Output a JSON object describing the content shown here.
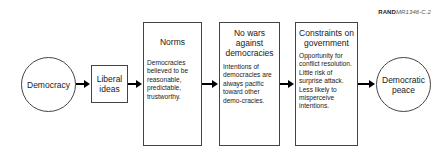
{
  "credit": {
    "org": "RAND",
    "code": "MR1346-C.2"
  },
  "nodes": [
    {
      "id": "democracy",
      "shape": "circle",
      "label": "Democracy"
    },
    {
      "id": "liberal-ideas",
      "shape": "box",
      "label": "Liberal ideas"
    },
    {
      "id": "norms",
      "shape": "box",
      "title": "Norms",
      "body": "Democracies believed to be reasonable, predictable, trustworthy."
    },
    {
      "id": "no-wars",
      "shape": "box",
      "title": "No wars against democracies",
      "body": "Intentions of democracies are always pacific toward other demo-cracies."
    },
    {
      "id": "constraints",
      "shape": "box",
      "title": "Constraints on government",
      "body": "Opportunity for conflict resolution. Little risk of surprise attack. Less likely to misperceive intentions."
    },
    {
      "id": "democratic-peace",
      "shape": "circle",
      "label": "Democratic peace"
    }
  ],
  "edges": [
    {
      "from": "democracy",
      "to": "liberal-ideas"
    },
    {
      "from": "liberal-ideas",
      "to": "norms"
    },
    {
      "from": "norms",
      "to": "no-wars"
    },
    {
      "from": "no-wars",
      "to": "constraints"
    },
    {
      "from": "constraints",
      "to": "democratic-peace"
    }
  ]
}
